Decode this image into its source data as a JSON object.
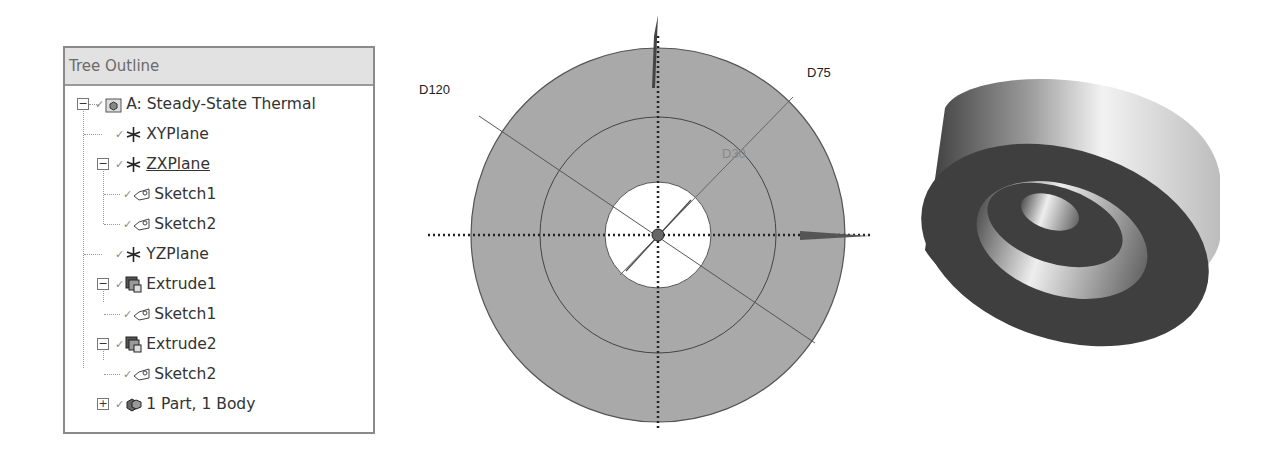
{
  "tree_panel": {
    "title": "Tree Outline",
    "items": [
      {
        "label": "A: Steady-State Thermal",
        "level": 0,
        "toggle": "minus",
        "icon": "analysis-icon"
      },
      {
        "label": "XYPlane",
        "level": 1,
        "toggle": null,
        "icon": "plane-icon"
      },
      {
        "label": "ZXPlane",
        "level": 1,
        "toggle": "minus",
        "icon": "plane-icon",
        "underlined": true
      },
      {
        "label": "Sketch1",
        "level": 2,
        "toggle": null,
        "icon": "sketch-icon"
      },
      {
        "label": "Sketch2",
        "level": 2,
        "toggle": null,
        "icon": "sketch-icon"
      },
      {
        "label": "YZPlane",
        "level": 1,
        "toggle": null,
        "icon": "plane-icon"
      },
      {
        "label": "Extrude1",
        "level": 1,
        "toggle": "minus",
        "icon": "extrude-icon"
      },
      {
        "label": "Sketch1",
        "level": 2,
        "toggle": null,
        "icon": "sketch-icon"
      },
      {
        "label": "Extrude2",
        "level": 1,
        "toggle": "minus",
        "icon": "extrude-icon"
      },
      {
        "label": "Sketch2",
        "level": 2,
        "toggle": null,
        "icon": "sketch-icon"
      },
      {
        "label": "1 Part, 1 Body",
        "level": 1,
        "toggle": "plus",
        "icon": "part-body-icon"
      }
    ]
  },
  "sketch_view": {
    "dimensions": {
      "outer": "D120",
      "middle": "D75",
      "inner": "D30"
    },
    "colors": {
      "fill": "#a9a9a9",
      "edge": "#555555"
    }
  },
  "model_view": {
    "description": "3D view of cylindrical ring body with stepped inner bore"
  }
}
